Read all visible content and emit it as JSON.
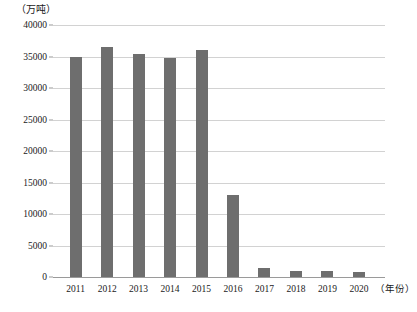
{
  "chart_data": {
    "type": "bar",
    "title": "",
    "subtitle": "",
    "unit_label": "（万吨）",
    "xlabel": "（年份）",
    "ylabel": "",
    "categories": [
      "2011",
      "2012",
      "2013",
      "2014",
      "2015",
      "2016",
      "2017",
      "2018",
      "2019",
      "2020"
    ],
    "values": [
      35000,
      36500,
      35400,
      34700,
      36100,
      13000,
      1500,
      1000,
      900,
      850
    ],
    "ylim": [
      0,
      40000
    ],
    "yticks": [
      0,
      5000,
      10000,
      15000,
      20000,
      25000,
      30000,
      35000,
      40000
    ],
    "ytick_labels": [
      "0",
      "5000",
      "10000",
      "15000",
      "20000",
      "25000",
      "30000",
      "35000",
      "40000"
    ],
    "grid": true,
    "legend": false,
    "legend_position": "none",
    "bar_color": "#6e6e6e",
    "grid_color": "#d2d2d2",
    "axis_color": "#9a9a9a",
    "background_color": "#ffffff"
  }
}
